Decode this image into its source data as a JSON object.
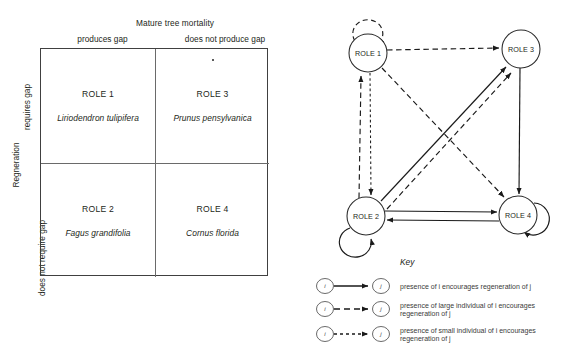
{
  "matrix": {
    "column_axis_title": "Mature tree mortality",
    "column_headers": [
      "produces gap",
      "does not produce gap"
    ],
    "row_axis_title": "Regneration",
    "row_headers": [
      "requires gap",
      "does not require gap"
    ],
    "cells": [
      {
        "role": "ROLE 1",
        "species": "Liriodendron tulipifera"
      },
      {
        "role": "ROLE 3",
        "species": "Prunus pensylvanica"
      },
      {
        "role": "ROLE 2",
        "species": "Fagus grandifolia"
      },
      {
        "role": "ROLE 4",
        "species": "Cornus florida"
      }
    ]
  },
  "network": {
    "nodes": [
      {
        "id": "role1",
        "label": "ROLE 1",
        "cx": 76,
        "cy": 53
      },
      {
        "id": "role3",
        "label": "ROLE 3",
        "cx": 229,
        "cy": 49
      },
      {
        "id": "role2",
        "label": "ROLE 2",
        "cx": 74,
        "cy": 216
      },
      {
        "id": "role4",
        "label": "ROLE 4",
        "cx": 226,
        "cy": 215
      }
    ],
    "edges": [
      {
        "from": "role1",
        "to": "role1",
        "style": "large-dashed",
        "kind": "self-loop"
      },
      {
        "from": "role2",
        "to": "role2",
        "style": "solid",
        "kind": "self-loop"
      },
      {
        "from": "role4",
        "to": "role4",
        "style": "solid",
        "kind": "self-loop"
      },
      {
        "from": "role1",
        "to": "role3",
        "style": "large-dashed",
        "kind": "straight"
      },
      {
        "from": "role3",
        "to": "role4",
        "style": "solid",
        "kind": "straight"
      },
      {
        "from": "role2",
        "to": "role4",
        "style": "solid",
        "kind": "straight"
      },
      {
        "from": "role4",
        "to": "role2",
        "style": "solid",
        "kind": "straight"
      },
      {
        "from": "role2",
        "to": "role1",
        "style": "large-dashed",
        "kind": "straight"
      },
      {
        "from": "role1",
        "to": "role2",
        "style": "small-dashed",
        "kind": "straight"
      },
      {
        "from": "role2",
        "to": "role3",
        "style": "solid",
        "kind": "diagonal"
      },
      {
        "from": "role2",
        "to": "role3",
        "style": "large-dashed",
        "kind": "diagonal"
      },
      {
        "from": "role1",
        "to": "role4",
        "style": "large-dashed",
        "kind": "diagonal"
      }
    ]
  },
  "key": {
    "title": "Key",
    "from_node_label": "i",
    "to_node_label": "j",
    "entries": [
      {
        "style": "solid",
        "text_line1": "presence of i encourages regeneration of j",
        "text_line2": ""
      },
      {
        "style": "large-dashed",
        "text_line1": "presence of large individual of i encourages",
        "text_line2": "regeneration of j"
      },
      {
        "style": "small-dashed",
        "text_line1": "presence of small individual of i encourages",
        "text_line2": "regeneration of j"
      }
    ]
  }
}
